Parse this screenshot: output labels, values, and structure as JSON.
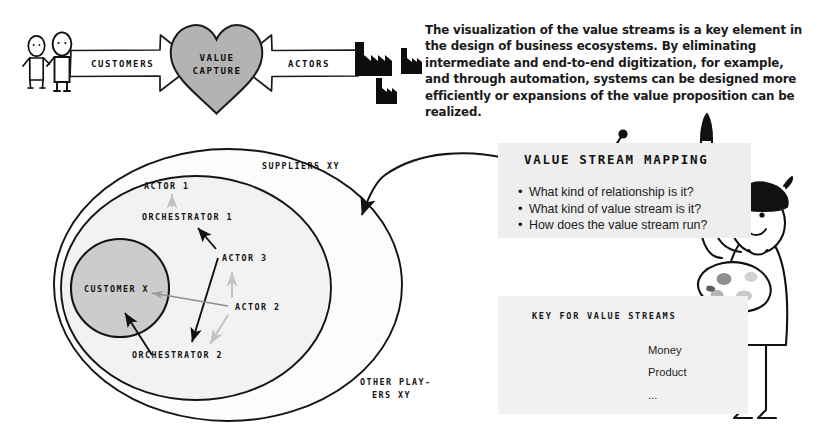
{
  "banner": {
    "customers_label": "CUSTOMERS",
    "actors_label": "ACTORS",
    "heart_line1": "VALUE",
    "heart_line2": "CAPTURE",
    "customer_figure_icon": "person-icon",
    "factory_icon": "factory-icon",
    "heart_icon": "heart-icon",
    "heart_fill": "#b3b3b3"
  },
  "intro": {
    "paragraph": "The visualization of the value streams is a key element in the design of business ecosystems. By eliminating intermediate and end-to-end digitization, for example, and through automation, systems can be designed more efficiently or expansions of the value proposition can be realized."
  },
  "ecosystem": {
    "outer_label_line1": "OTHER PLAY-",
    "outer_label_line2": "ERS XY",
    "middle_label": "SUPPLIERS XY",
    "inner_label": "CUSTOMER X",
    "nodes": [
      {
        "label": "ACTOR 1"
      },
      {
        "label": "ORCHESTRATOR 1"
      },
      {
        "label": "ACTOR 3"
      },
      {
        "label": "ACTOR 2"
      },
      {
        "label": "ORCHESTRATOR 2"
      }
    ],
    "outer_fill": "#fcfcfc",
    "middle_fill": "#f2f2f2",
    "inner_fill": "#cccccc"
  },
  "note": {
    "title": "VALUE STREAM MAPPING",
    "bullets": [
      "What kind of relationship is it?",
      "What kind of value stream is it?",
      "How does the value stream run?"
    ],
    "pin_icon": "pushpin-icon",
    "background": "#eeeeee"
  },
  "legend": {
    "title": "KEY FOR VALUE STREAMS",
    "items": [
      {
        "label": "Money",
        "color": "#c4c4c4"
      },
      {
        "label": "Product",
        "color": "#9a9a9a"
      },
      {
        "label": "...",
        "color": "#111111"
      }
    ],
    "background": "#f1f1f1"
  },
  "artist": {
    "brush_icon": "paintbrush-icon",
    "palette_icon": "palette-icon",
    "beret_icon": "beret-icon"
  }
}
